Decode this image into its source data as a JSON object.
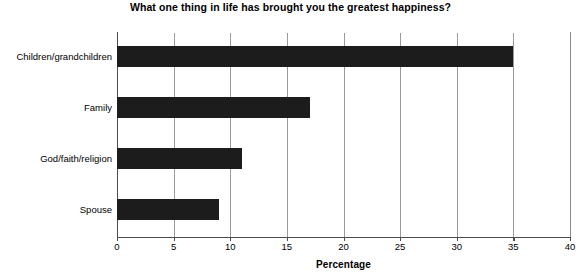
{
  "chart_data": {
    "type": "bar",
    "orientation": "horizontal",
    "title": "What one thing in life has brought you the greatest happiness?",
    "xlabel": "Percentage",
    "ylabel": "",
    "categories": [
      "Children/grandchildren",
      "Family",
      "God/faith/religion",
      "Spouse"
    ],
    "values": [
      35,
      17,
      11,
      9
    ],
    "xlim": [
      0,
      40
    ],
    "xticks": [
      0,
      5,
      10,
      15,
      20,
      25,
      30,
      35,
      40
    ],
    "xtick_labels": [
      "0",
      "5",
      "10",
      "15",
      "20",
      "25",
      "30",
      "35",
      "40"
    ],
    "grid": "vertical",
    "legend": "none",
    "bar_color": "#1c1c1c",
    "gridline_color": "#9a9a9a",
    "axis_color": "#4d4d4d",
    "background_color": "#ffffff"
  }
}
